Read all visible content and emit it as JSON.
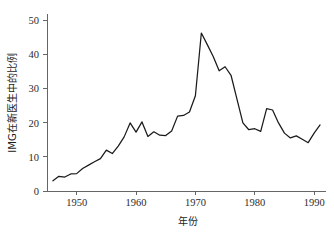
{
  "chart_data": {
    "type": "line",
    "title": "",
    "xlabel": "年份",
    "ylabel": "IMG在新医生中的比例",
    "xlim": [
      1945,
      1992
    ],
    "ylim": [
      0,
      52
    ],
    "grid": false,
    "legend": false,
    "legend_position": "none",
    "line_color": "#1a1a1a",
    "xticks": [
      1950,
      1960,
      1970,
      1980,
      1990
    ],
    "xtick_labels": [
      "1950",
      "1960",
      "1970",
      "1980",
      "1990"
    ],
    "yticks": [
      0,
      10,
      20,
      30,
      40,
      50
    ],
    "ytick_labels": [
      "0",
      "10",
      "20",
      "30",
      "40",
      "50"
    ],
    "series": [
      {
        "name": "IMG在新医生中的比例",
        "x": [
          1946,
          1947,
          1948,
          1949,
          1950,
          1951,
          1952,
          1953,
          1954,
          1955,
          1956,
          1957,
          1958,
          1959,
          1960,
          1961,
          1962,
          1963,
          1964,
          1965,
          1966,
          1967,
          1968,
          1969,
          1970,
          1971,
          1972,
          1973,
          1974,
          1975,
          1976,
          1977,
          1978,
          1979,
          1980,
          1981,
          1982,
          1983,
          1984,
          1985,
          1986,
          1987,
          1988,
          1989,
          1990,
          1991
        ],
        "values": [
          3.0,
          4.3,
          4.1,
          5.0,
          5.1,
          6.6,
          7.6,
          8.6,
          9.5,
          12.0,
          11.0,
          13.2,
          15.9,
          20.0,
          17.3,
          20.3,
          16.0,
          17.4,
          16.4,
          16.3,
          17.6,
          22.0,
          22.2,
          23.2,
          28.0,
          46.4,
          43.0,
          39.5,
          35.3,
          36.5,
          34.0,
          27.0,
          20.0,
          18.0,
          18.3,
          17.5,
          24.2,
          23.8,
          20.0,
          17.0,
          15.6,
          16.2,
          15.2,
          14.2,
          17.0,
          19.4
        ]
      }
    ]
  }
}
